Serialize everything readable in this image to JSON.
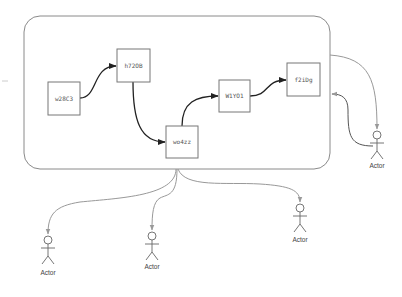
{
  "diagram": {
    "container": {
      "x": 24,
      "y": 16,
      "width": 306,
      "height": 153,
      "radius": 16
    },
    "nodes": [
      {
        "id": "w28C3",
        "label": "w28C3",
        "x": 48,
        "y": 82,
        "w": 32,
        "h": 33
      },
      {
        "id": "h72OB",
        "label": "h72OB",
        "x": 117,
        "y": 49,
        "w": 33,
        "h": 33
      },
      {
        "id": "wo4zz",
        "label": "wo4zz",
        "x": 166,
        "y": 126,
        "w": 32,
        "h": 32
      },
      {
        "id": "W1YO1",
        "label": "W1YO1",
        "x": 219,
        "y": 80,
        "w": 31,
        "h": 32
      },
      {
        "id": "f2iDg",
        "label": "f2iDg",
        "x": 287,
        "y": 63,
        "w": 33,
        "h": 33
      }
    ],
    "actors": [
      {
        "id": "actor-right",
        "label": "Actor",
        "x": 377,
        "y": 135
      },
      {
        "id": "actor-bottom-left",
        "label": "Actor",
        "x": 48,
        "y": 240
      },
      {
        "id": "actor-bottom-middle",
        "label": "Actor",
        "x": 152,
        "y": 236
      },
      {
        "id": "actor-bottom-right",
        "label": "Actor",
        "x": 300,
        "y": 208
      }
    ],
    "edges": [
      {
        "from": "w28C3",
        "to": "h72OB"
      },
      {
        "from": "h72OB",
        "to": "wo4zz"
      },
      {
        "from": "wo4zz",
        "to": "W1YO1"
      },
      {
        "from": "W1YO1",
        "to": "f2iDg"
      },
      {
        "from": "container",
        "to": "actor-right"
      },
      {
        "from": "actor-right",
        "to": "container"
      },
      {
        "from": "container",
        "to": "actor-bottom-left"
      },
      {
        "from": "container",
        "to": "actor-bottom-middle"
      },
      {
        "from": "container",
        "to": "actor-bottom-right"
      }
    ],
    "colors": {
      "container_stroke": "#8a8a8a",
      "node_stroke": "#777777",
      "edge_dark": "#222222",
      "edge_light": "#9a9a9a",
      "actor_stroke": "#666666"
    }
  }
}
